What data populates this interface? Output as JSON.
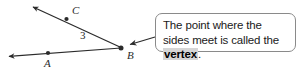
{
  "figure": {
    "type": "geometry-angle-diagram",
    "background_color": "#ffffff",
    "line_color": "#2b2b2b"
  },
  "diagram": {
    "vertex_label": "B",
    "ray_point_labels": {
      "upper": "C",
      "lower": "A"
    },
    "angle_number_label": "3",
    "points": {
      "B": {
        "x": 121,
        "y": 48
      },
      "C": {
        "x": 66,
        "y": 19
      },
      "A": {
        "x": 48,
        "y": 52
      },
      "upper_arrow_tip": {
        "x": 30,
        "y": 5
      },
      "lower_arrow_tip": {
        "x": 5,
        "y": 57
      }
    }
  },
  "callout": {
    "text_before": "The point where the sides meet is called the ",
    "highlighted_term": "vertex",
    "text_after": ".",
    "full_text": "The point where the sides meet is called the vertex.",
    "border_color": "#8a8a8a",
    "highlight_color": "#d6d6d6",
    "pointer_target": "vertex-B"
  }
}
